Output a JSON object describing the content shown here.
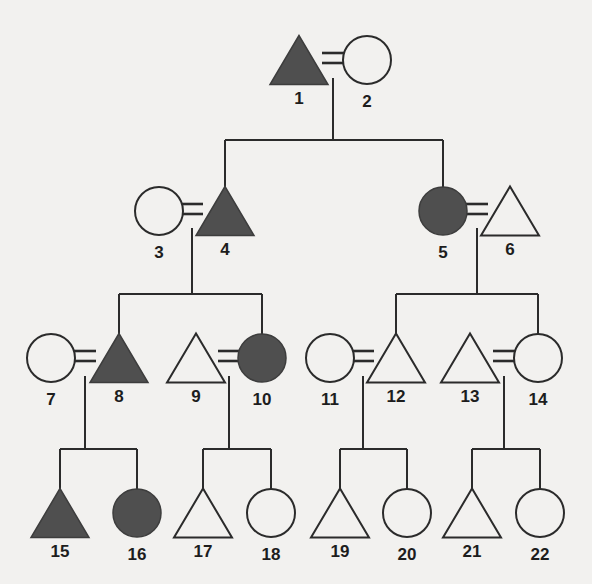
{
  "figure": {
    "type": "pedigree-chart",
    "width": 592,
    "height": 584,
    "background_color": "#f2f1ef",
    "line_color": "#2b2b2b",
    "affected_fill_color": "#4f4f4f",
    "unaffected_fill_color": "#f2f1ef",
    "generations": 4,
    "individual_count": 22
  },
  "legend_semantics": {
    "triangle": "male",
    "circle": "female",
    "filled": "affected",
    "open": "unaffected",
    "equals_sign": "mating / union",
    "vertical_line": "line of descent",
    "horizontal_bar": "sibship line"
  },
  "individuals": [
    {
      "id": "1",
      "label": "1",
      "shape": "triangle",
      "filled": true,
      "generation": 1,
      "cx": 299,
      "cy": 60
    },
    {
      "id": "2",
      "label": "2",
      "shape": "circle",
      "filled": false,
      "generation": 1,
      "cx": 367,
      "cy": 60
    },
    {
      "id": "3",
      "label": "3",
      "shape": "circle",
      "filled": false,
      "generation": 2,
      "cx": 159,
      "cy": 211
    },
    {
      "id": "4",
      "label": "4",
      "shape": "triangle",
      "filled": true,
      "generation": 2,
      "cx": 225,
      "cy": 211
    },
    {
      "id": "5",
      "label": "5",
      "shape": "circle",
      "filled": true,
      "generation": 2,
      "cx": 443,
      "cy": 211
    },
    {
      "id": "6",
      "label": "6",
      "shape": "triangle",
      "filled": false,
      "generation": 2,
      "cx": 510,
      "cy": 211
    },
    {
      "id": "7",
      "label": "7",
      "shape": "circle",
      "filled": false,
      "generation": 3,
      "cx": 51,
      "cy": 358
    },
    {
      "id": "8",
      "label": "8",
      "shape": "triangle",
      "filled": true,
      "generation": 3,
      "cx": 119,
      "cy": 358
    },
    {
      "id": "9",
      "label": "9",
      "shape": "triangle",
      "filled": false,
      "generation": 3,
      "cx": 196,
      "cy": 358
    },
    {
      "id": "10",
      "label": "10",
      "shape": "circle",
      "filled": true,
      "generation": 3,
      "cx": 262,
      "cy": 358
    },
    {
      "id": "11",
      "label": "11",
      "shape": "circle",
      "filled": false,
      "generation": 3,
      "cx": 330,
      "cy": 358
    },
    {
      "id": "12",
      "label": "12",
      "shape": "triangle",
      "filled": false,
      "generation": 3,
      "cx": 396,
      "cy": 358
    },
    {
      "id": "13",
      "label": "13",
      "shape": "triangle",
      "filled": false,
      "generation": 3,
      "cx": 470,
      "cy": 358
    },
    {
      "id": "14",
      "label": "14",
      "shape": "circle",
      "filled": false,
      "generation": 3,
      "cx": 538,
      "cy": 358
    },
    {
      "id": "15",
      "label": "15",
      "shape": "triangle",
      "filled": true,
      "generation": 4,
      "cx": 60,
      "cy": 513
    },
    {
      "id": "16",
      "label": "16",
      "shape": "circle",
      "filled": true,
      "generation": 4,
      "cx": 137,
      "cy": 513
    },
    {
      "id": "17",
      "label": "17",
      "shape": "triangle",
      "filled": false,
      "generation": 4,
      "cx": 203,
      "cy": 513
    },
    {
      "id": "18",
      "label": "18",
      "shape": "circle",
      "filled": false,
      "generation": 4,
      "cx": 271,
      "cy": 513
    },
    {
      "id": "19",
      "label": "19",
      "shape": "triangle",
      "filled": false,
      "generation": 4,
      "cx": 340,
      "cy": 513
    },
    {
      "id": "20",
      "label": "20",
      "shape": "circle",
      "filled": false,
      "generation": 4,
      "cx": 407,
      "cy": 513
    },
    {
      "id": "21",
      "label": "21",
      "shape": "triangle",
      "filled": false,
      "generation": 4,
      "cx": 472,
      "cy": 513
    },
    {
      "id": "22",
      "label": "22",
      "shape": "circle",
      "filled": false,
      "generation": 4,
      "cx": 540,
      "cy": 513
    }
  ],
  "matings": [
    {
      "id": "m1-2",
      "left": "1",
      "right": "2",
      "eq_x": 333,
      "eq_y": 58
    },
    {
      "id": "m3-4",
      "left": "3",
      "right": "4",
      "eq_x": 192,
      "eq_y": 209
    },
    {
      "id": "m5-6",
      "left": "5",
      "right": "6",
      "eq_x": 477,
      "eq_y": 209
    },
    {
      "id": "m7-8",
      "left": "7",
      "right": "8",
      "eq_x": 85,
      "eq_y": 356
    },
    {
      "id": "m9-10",
      "left": "9",
      "right": "10",
      "eq_x": 229,
      "eq_y": 356
    },
    {
      "id": "m11-12",
      "left": "11",
      "right": "12",
      "eq_x": 363,
      "eq_y": 356
    },
    {
      "id": "m13-14",
      "left": "13",
      "right": "14",
      "eq_x": 504,
      "eq_y": 356
    }
  ],
  "sibships": [
    {
      "id": "s1",
      "parents": "m1-2",
      "children": [
        "4",
        "5"
      ],
      "drop_x": 333,
      "drop_from": 78,
      "bar_y": 140,
      "bar_x1": 225,
      "bar_x2": 443,
      "child_drop_to": 190
    },
    {
      "id": "s2",
      "parents": "m3-4",
      "children": [
        "8",
        "10"
      ],
      "drop_x": 192,
      "drop_from": 228,
      "bar_y": 294,
      "bar_x1": 119,
      "bar_x2": 262,
      "child_drop_to": 338
    },
    {
      "id": "s3",
      "parents": "m5-6",
      "children": [
        "12",
        "14"
      ],
      "drop_x": 477,
      "drop_from": 228,
      "bar_y": 294,
      "bar_x1": 396,
      "bar_x2": 538,
      "child_drop_to": 338
    },
    {
      "id": "s4",
      "parents": "m7-8",
      "children": [
        "15",
        "16"
      ],
      "drop_x": 85,
      "drop_from": 376,
      "bar_y": 449,
      "bar_x1": 60,
      "bar_x2": 137,
      "child_drop_to": 493
    },
    {
      "id": "s5",
      "parents": "m9-10",
      "children": [
        "17",
        "18"
      ],
      "drop_x": 229,
      "drop_from": 376,
      "bar_y": 449,
      "bar_x1": 203,
      "bar_x2": 271,
      "child_drop_to": 493
    },
    {
      "id": "s6",
      "parents": "m11-12",
      "children": [
        "19",
        "20"
      ],
      "drop_x": 363,
      "drop_from": 376,
      "bar_y": 449,
      "bar_x1": 340,
      "bar_x2": 407,
      "child_drop_to": 493
    },
    {
      "id": "s7",
      "parents": "m13-14",
      "children": [
        "21",
        "22"
      ],
      "drop_x": 504,
      "drop_from": 376,
      "bar_y": 449,
      "bar_x1": 472,
      "bar_x2": 540,
      "child_drop_to": 493
    }
  ],
  "parent_stub_lines": [
    {
      "id": "stub-4",
      "x": 225,
      "y1": 140,
      "y2": 193
    },
    {
      "id": "stub-5",
      "x": 443,
      "y1": 140,
      "y2": 193
    },
    {
      "id": "stub-8",
      "x": 119,
      "y1": 294,
      "y2": 340
    },
    {
      "id": "stub-10",
      "x": 262,
      "y1": 294,
      "y2": 340
    },
    {
      "id": "stub-12",
      "x": 396,
      "y1": 294,
      "y2": 340
    },
    {
      "id": "stub-14",
      "x": 538,
      "y1": 294,
      "y2": 340
    }
  ],
  "child_stub_lines": [
    {
      "id": "cstub-15",
      "x": 60,
      "y1": 449,
      "y2": 497
    },
    {
      "id": "cstub-16",
      "x": 137,
      "y1": 449,
      "y2": 497
    },
    {
      "id": "cstub-17",
      "x": 203,
      "y1": 449,
      "y2": 497
    },
    {
      "id": "cstub-18",
      "x": 271,
      "y1": 449,
      "y2": 497
    },
    {
      "id": "cstub-19",
      "x": 340,
      "y1": 449,
      "y2": 497
    },
    {
      "id": "cstub-20",
      "x": 407,
      "y1": 449,
      "y2": 497
    },
    {
      "id": "cstub-21",
      "x": 472,
      "y1": 449,
      "y2": 497
    },
    {
      "id": "cstub-22",
      "x": 540,
      "y1": 449,
      "y2": 497
    }
  ]
}
